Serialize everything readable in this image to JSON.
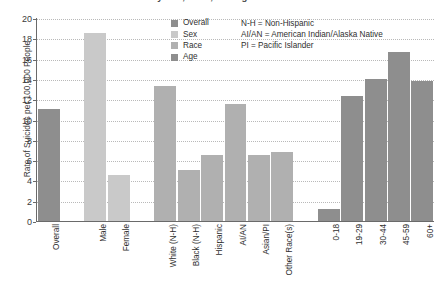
{
  "chart_data": {
    "type": "bar",
    "title": "by Sex, Race, and Age in 2017",
    "xlabel": "",
    "ylabel": "Rate of Suicides per 100,000 People",
    "ylim": [
      0,
      20
    ],
    "ytick_step": 2,
    "yticks": [
      "0",
      "2",
      "4",
      "6",
      "8",
      "10",
      "12",
      "14",
      "16",
      "18",
      "20"
    ],
    "grid": true,
    "legend_position": "top-center",
    "categories": [
      "Overall",
      "Male",
      "Female",
      "White (N-H)",
      "Black (N-H)",
      "Hispanic",
      "AI/AN",
      "Asian/PI",
      "Other Race(s)",
      "0-18",
      "19-29",
      "30-44",
      "45-59",
      "60+"
    ],
    "values": [
      11.0,
      18.5,
      4.5,
      13.3,
      5.0,
      6.5,
      11.5,
      6.5,
      6.8,
      1.2,
      12.3,
      14.0,
      16.7,
      13.8
    ],
    "groups": [
      {
        "name": "Overall",
        "color": "#8e8e8e",
        "categories": [
          "Overall"
        ]
      },
      {
        "name": "Sex",
        "color": "#c9c9c9",
        "categories": [
          "Male",
          "Female"
        ]
      },
      {
        "name": "Race",
        "color": "#b0b0b0",
        "categories": [
          "White (N-H)",
          "Black (N-H)",
          "Hispanic",
          "AI/AN",
          "Asian/PI",
          "Other Race(s)"
        ]
      },
      {
        "name": "Age",
        "color": "#8e8e8e",
        "categories": [
          "0-18",
          "19-29",
          "30-44",
          "45-59",
          "60+"
        ]
      }
    ],
    "bars": [
      {
        "label": "Overall",
        "value": 11.0,
        "group": "Overall",
        "color": "#8e8e8e",
        "slot": 0
      },
      {
        "label": "Male",
        "value": 18.5,
        "group": "Sex",
        "color": "#c9c9c9",
        "slot": 2
      },
      {
        "label": "Female",
        "value": 4.5,
        "group": "Sex",
        "color": "#c9c9c9",
        "slot": 3
      },
      {
        "label": "White (N-H)",
        "value": 13.3,
        "group": "Race",
        "color": "#b0b0b0",
        "slot": 5
      },
      {
        "label": "Black (N-H)",
        "value": 5.0,
        "group": "Race",
        "color": "#b0b0b0",
        "slot": 6
      },
      {
        "label": "Hispanic",
        "value": 6.5,
        "group": "Race",
        "color": "#b0b0b0",
        "slot": 7
      },
      {
        "label": "AI/AN",
        "value": 11.5,
        "group": "Race",
        "color": "#b0b0b0",
        "slot": 8
      },
      {
        "label": "Asian/PI",
        "value": 6.5,
        "group": "Race",
        "color": "#b0b0b0",
        "slot": 9
      },
      {
        "label": "Other Race(s)",
        "value": 6.8,
        "group": "Race",
        "color": "#b0b0b0",
        "slot": 10
      },
      {
        "label": "0-18",
        "value": 1.2,
        "group": "Age",
        "color": "#8e8e8e",
        "slot": 12
      },
      {
        "label": "19-29",
        "value": 12.3,
        "group": "Age",
        "color": "#8e8e8e",
        "slot": 13
      },
      {
        "label": "30-44",
        "value": 14.0,
        "group": "Age",
        "color": "#8e8e8e",
        "slot": 14
      },
      {
        "label": "45-59",
        "value": 16.7,
        "group": "Age",
        "color": "#8e8e8e",
        "slot": 15
      },
      {
        "label": "60+",
        "value": 13.8,
        "group": "Age",
        "color": "#8e8e8e",
        "slot": 16
      }
    ],
    "annotations": [
      "N-H = Non-Hispanic",
      "AI/AN = American Indian/Alaska Native",
      "PI = Pacific Islander"
    ]
  }
}
